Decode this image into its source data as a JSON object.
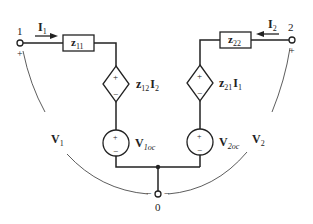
{
  "diagram": {
    "type": "two-port z-parameter equivalent circuit",
    "terminals": {
      "port1": "1",
      "port2": "2",
      "ground": "0"
    },
    "currents": {
      "i1": {
        "main": "I",
        "sub": "1"
      },
      "i2": {
        "main": "I",
        "sub": "2"
      }
    },
    "impedances": {
      "z11": {
        "main": "z",
        "sub": "11"
      },
      "z22": {
        "main": "z",
        "sub": "22"
      }
    },
    "dependent_sources": {
      "left": {
        "main1": "z",
        "sub1": "12",
        "main2": "I",
        "sub2": "2"
      },
      "right": {
        "main1": "z",
        "sub1": "21",
        "main2": "I",
        "sub2": "1"
      }
    },
    "independent_sources": {
      "left": {
        "main": "V",
        "sub": "1oc"
      },
      "right": {
        "main": "V",
        "sub": "2oc"
      }
    },
    "voltages": {
      "v1": {
        "main": "V",
        "sub": "1"
      },
      "v2": {
        "main": "V",
        "sub": "2"
      }
    },
    "polarity": {
      "plus": "+",
      "minus": "−"
    }
  }
}
